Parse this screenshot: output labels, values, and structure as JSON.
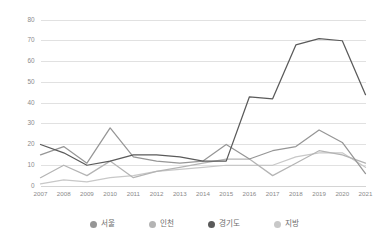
{
  "chart_data": {
    "type": "line",
    "title": "",
    "subtitle": "",
    "xlabel": "",
    "ylabel": "",
    "categories": [
      "2007",
      "2008",
      "2009",
      "2010",
      "2011",
      "2012",
      "2013",
      "2014",
      "2015",
      "2016",
      "2017",
      "2018",
      "2019",
      "2020",
      "2021"
    ],
    "ylim": [
      0,
      80
    ],
    "ytick_values": [
      0,
      10,
      20,
      30,
      40,
      50,
      60,
      70,
      80
    ],
    "ytick_labels": [
      "0",
      "10",
      "20",
      "30",
      "40",
      "50",
      "60",
      "70",
      "80"
    ],
    "grid": true,
    "grid_axis": "y",
    "legend_position": "bottom",
    "series": [
      {
        "name": "서울",
        "color": "#969696",
        "values": [
          15,
          19,
          11,
          28,
          14,
          12,
          11,
          12,
          20,
          13,
          17,
          19,
          27,
          21,
          6
        ]
      },
      {
        "name": "인천",
        "color": "#b4b4b4",
        "values": [
          4,
          10,
          5,
          12,
          4,
          7,
          9,
          11,
          13,
          13,
          5,
          11,
          17,
          15,
          11
        ]
      },
      {
        "name": "경기도",
        "color": "#5a5a5a",
        "values": [
          20,
          16,
          10,
          12,
          15,
          15,
          14,
          12,
          12,
          43,
          42,
          68,
          71,
          70,
          44
        ]
      },
      {
        "name": "지방",
        "color": "#c8c8c8",
        "values": [
          1,
          3,
          2,
          4,
          5,
          7,
          8,
          9,
          10,
          10,
          10,
          14,
          16,
          16,
          9
        ]
      }
    ]
  },
  "legend": {
    "items": [
      {
        "label": "서울",
        "color": "#969696"
      },
      {
        "label": "인천",
        "color": "#b4b4b4"
      },
      {
        "label": "경기도",
        "color": "#5a5a5a"
      },
      {
        "label": "지방",
        "color": "#c8c8c8"
      }
    ]
  },
  "colors": {
    "grid": "#d4d4d4",
    "axis": "#c9c9c9",
    "tick_text": "#8a8a8a",
    "legend_text": "#6e6e6e",
    "background": "#ffffff"
  }
}
